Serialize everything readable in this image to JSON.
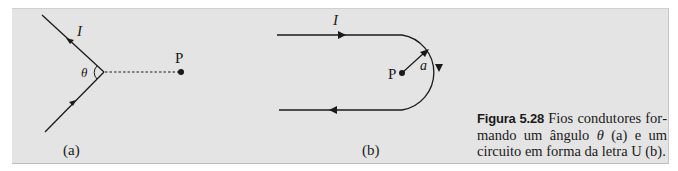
{
  "figure": {
    "panel_a": {
      "current_label": "I",
      "angle_label": "θ",
      "point_label": "P",
      "sublabel": "(a)"
    },
    "panel_b": {
      "current_label": "I",
      "point_label": "P",
      "radius_label": "a",
      "sublabel": "(b)"
    },
    "caption": {
      "lead": "Figura 5.28",
      "text_1": " Fios condutores for­mando um ângulo ",
      "symbol": "θ",
      "text_2": " (a) e um circuito em forma da letra U (b)."
    },
    "colors": {
      "panel_background": "#e4e4e4",
      "ink": "#1a1a1a"
    }
  }
}
